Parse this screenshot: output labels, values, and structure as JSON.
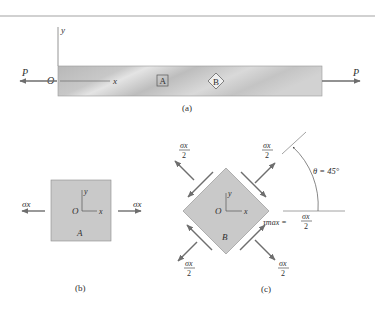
{
  "colors": {
    "bar_fill_light": "#dcdcdc",
    "bar_fill_dark": "#b4b4b4",
    "element_fill": "#c9c9c9",
    "arrow": "#6e6e6e",
    "line": "#7a7a7a",
    "rule": "#bdbdbd"
  },
  "panel_a": {
    "caption": "(a)",
    "axis_y_label": "y",
    "axis_x_label": "x",
    "origin_label": "O",
    "load_left_label": "P",
    "load_right_label": "P",
    "element_a_label": "A",
    "element_b_label": "B"
  },
  "panel_b": {
    "caption": "(b)",
    "stress_left_label": "σx",
    "stress_right_label": "σx",
    "axis_y_label": "y",
    "axis_x_label": "x",
    "origin_label": "O",
    "element_label": "A"
  },
  "panel_c": {
    "caption": "(c)",
    "normal_stress_numerator": "σx",
    "normal_stress_denominator": "2",
    "shear_label": "τmax =",
    "shear_numerator": "σx",
    "shear_denominator": "2",
    "angle_label": "θ = 45°",
    "axis_y_label": "y",
    "axis_x_label": "x",
    "origin_label": "O",
    "element_label": "B"
  }
}
